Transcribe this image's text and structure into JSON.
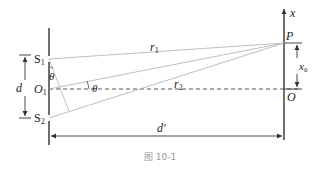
{
  "figure": {
    "caption": "图 10-1",
    "labels": {
      "s1": "S",
      "s1_sub": "1",
      "s2": "S",
      "s2_sub": "2",
      "o1": "O",
      "o1_sub": "1",
      "d": "d",
      "d_prime": "d′",
      "theta_left": "θ",
      "theta_center": "θ",
      "r1": "r",
      "r1_sub": "1",
      "r2": "r",
      "r2_sub": "2",
      "p": "P",
      "o": "O",
      "x_axis": "x",
      "x0": "x",
      "x0_sub": "0"
    },
    "colors": {
      "line": "#333333",
      "ray": "#b8b8b8",
      "caption": "#9a9a9a"
    }
  }
}
